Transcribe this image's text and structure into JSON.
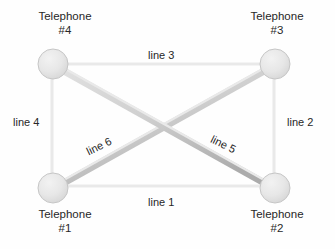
{
  "diagram": {
    "background_color": "#fefefe",
    "node_fill_color": "#e8e8e8",
    "node_edge_color": "#bfbfbf",
    "line_color": "#c9c9c9",
    "line_shadow_color": "#a8a8a8",
    "text_color": "#272727",
    "nodes": [
      {
        "id": "telephone-4",
        "label_line1": "Telephone",
        "label_line2": "#4",
        "cx": 53,
        "cy": 64,
        "r": 15,
        "label_position": "top"
      },
      {
        "id": "telephone-3",
        "label_line1": "Telephone",
        "label_line2": "#3",
        "cx": 275,
        "cy": 64,
        "r": 15,
        "label_position": "top"
      },
      {
        "id": "telephone-1",
        "label_line1": "Telephone",
        "label_line2": "#1",
        "cx": 53,
        "cy": 188,
        "r": 15,
        "label_position": "bottom"
      },
      {
        "id": "telephone-2",
        "label_line1": "Telephone",
        "label_line2": "#2",
        "cx": 275,
        "cy": 188,
        "r": 15,
        "label_position": "bottom"
      }
    ],
    "edges": [
      {
        "id": "line-1",
        "label": "line 1",
        "from": "telephone-1",
        "to": "telephone-2",
        "x1": 53,
        "y1": 188,
        "x2": 275,
        "y2": 188,
        "label_x": 148,
        "label_y": 196,
        "label_rotation": 0
      },
      {
        "id": "line-2",
        "label": "line 2",
        "from": "telephone-3",
        "to": "telephone-2",
        "x1": 275,
        "y1": 64,
        "x2": 275,
        "y2": 188,
        "label_x": 287,
        "label_y": 116,
        "label_rotation": 0
      },
      {
        "id": "line-3",
        "label": "line 3",
        "from": "telephone-4",
        "to": "telephone-3",
        "x1": 53,
        "y1": 64,
        "x2": 275,
        "y2": 64,
        "label_x": 148,
        "label_y": 49,
        "label_rotation": 0
      },
      {
        "id": "line-4",
        "label": "line 4",
        "from": "telephone-4",
        "to": "telephone-1",
        "x1": 53,
        "y1": 64,
        "x2": 53,
        "y2": 188,
        "label_x": 13,
        "label_y": 116,
        "label_rotation": 0
      },
      {
        "id": "line-5",
        "label": "line 5",
        "from": "telephone-4",
        "to": "telephone-2",
        "x1": 53,
        "y1": 64,
        "x2": 275,
        "y2": 188,
        "label_x": 210,
        "label_y": 138,
        "label_rotation": 26
      },
      {
        "id": "line-6",
        "label": "line 6",
        "from": "telephone-1",
        "to": "telephone-3",
        "x1": 53,
        "y1": 188,
        "x2": 275,
        "y2": 64,
        "label_x": 86,
        "label_y": 140,
        "label_rotation": -26
      }
    ]
  }
}
